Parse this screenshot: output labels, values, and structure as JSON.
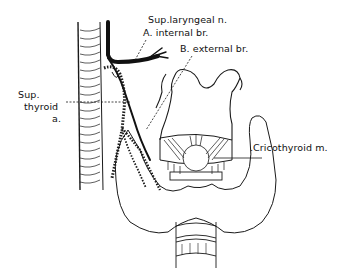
{
  "figure": {
    "colors": {
      "line": "#1a1a1a",
      "background": "#ffffff",
      "nerve": "#111111"
    }
  },
  "labels": {
    "sup_laryngeal": "Sup.laryngeal n.",
    "internal_br": "A. internal br.",
    "external_br": "B. external br.",
    "sup_thyroid_1": "Sup.",
    "sup_thyroid_2": "thyroid",
    "sup_thyroid_3": "a.",
    "cricothyroid": ".Cricothyroid m."
  }
}
